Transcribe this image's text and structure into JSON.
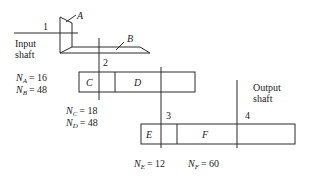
{
  "diagram": {
    "shafts": [
      {
        "id": "1",
        "label": "1",
        "name": "Input shaft",
        "name_lines": [
          "Input",
          "shaft"
        ]
      },
      {
        "id": "2",
        "label": "2"
      },
      {
        "id": "3",
        "label": "3"
      },
      {
        "id": "4",
        "label": "4",
        "name": "Output shaft",
        "name_lines": [
          "Output",
          "shaft"
        ]
      }
    ],
    "gears": [
      {
        "id": "A",
        "label": "A",
        "teeth": 16
      },
      {
        "id": "B",
        "label": "B",
        "teeth": 48
      },
      {
        "id": "C",
        "label": "C",
        "teeth": 18
      },
      {
        "id": "D",
        "label": "D",
        "teeth": 48
      },
      {
        "id": "E",
        "label": "E",
        "teeth": 12
      },
      {
        "id": "F",
        "label": "F",
        "teeth": 60
      }
    ],
    "teeth_labels": {
      "NA": {
        "sym": "N",
        "sub": "A",
        "val": "= 16"
      },
      "NB": {
        "sym": "N",
        "sub": "B",
        "val": "= 48"
      },
      "NC": {
        "sym": "N",
        "sub": "C",
        "val": "= 18"
      },
      "ND": {
        "sym": "N",
        "sub": "D",
        "val": "= 48"
      },
      "NE": {
        "sym": "N",
        "sub": "E",
        "val": "= 12"
      },
      "NF": {
        "sym": "N",
        "sub": "F",
        "val": "= 60"
      }
    }
  }
}
